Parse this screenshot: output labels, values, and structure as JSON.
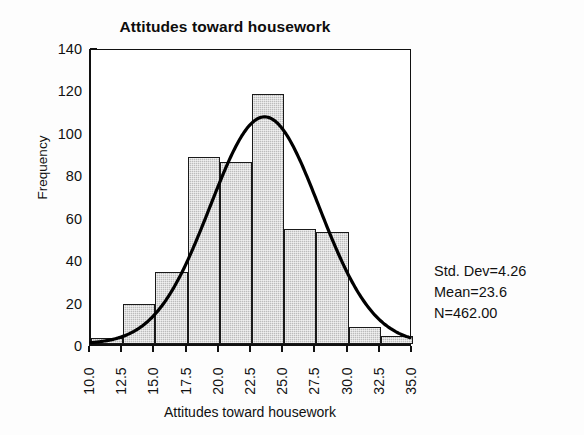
{
  "chart_data": {
    "type": "bar",
    "title": "Attitudes toward housework",
    "xlabel": "Attitudes toward housework",
    "ylabel": "Frequency",
    "grid": false,
    "legend": null,
    "xlim": [
      10.0,
      35.0
    ],
    "ylim": [
      0,
      140
    ],
    "x_tick_labels": [
      "10.0",
      "12.5",
      "15.0",
      "17.5",
      "20.0",
      "22.5",
      "25.0",
      "27.5",
      "30.0",
      "32.5",
      "35.0"
    ],
    "x_tick_values": [
      10.0,
      12.5,
      15.0,
      17.5,
      20.0,
      22.5,
      25.0,
      27.5,
      30.0,
      32.5,
      35.0
    ],
    "y_tick_labels": [
      "0",
      "20",
      "40",
      "60",
      "80",
      "100",
      "120",
      "140"
    ],
    "y_tick_values": [
      0,
      20,
      40,
      60,
      80,
      100,
      120,
      140
    ],
    "bin_width": 2.5,
    "bin_edges": [
      10.0,
      12.5,
      15.0,
      17.5,
      20.0,
      22.5,
      25.0,
      27.5,
      30.0,
      32.5,
      35.0
    ],
    "categories": [
      "10.0-12.5",
      "12.5-15.0",
      "15.0-17.5",
      "17.5-20.0",
      "20.0-22.5",
      "22.5-25.0",
      "25.0-27.5",
      "27.5-30.0",
      "30.0-32.5",
      "32.5-35.0"
    ],
    "bin_centers": [
      11.25,
      13.75,
      16.25,
      18.75,
      21.25,
      23.75,
      26.25,
      28.75,
      31.25,
      33.75
    ],
    "values": [
      3,
      19,
      34,
      88,
      86,
      118,
      54,
      53,
      8,
      4
    ],
    "bar_fill_color": "#bcbcbc",
    "bar_edge_color": "#1a1a1a",
    "overlay": {
      "type": "line",
      "name": "normal curve",
      "color": "#000000",
      "mean": 23.6,
      "std_dev": 4.26,
      "n": 462,
      "peak_value": 107
    },
    "annotations": [
      "Std. Dev=4.26",
      "Mean=23.6",
      "N=462.00"
    ]
  },
  "stats": {
    "std_dev_line": "Std. Dev=4.26",
    "mean_line": "Mean=23.6",
    "n_line": "N=462.00"
  }
}
